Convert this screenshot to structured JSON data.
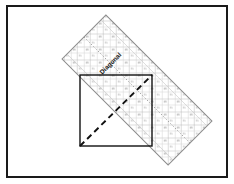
{
  "figure": {
    "frame": {
      "border_color": "#1a1a1a",
      "background_color": "#ffffff",
      "border_width_px": 2,
      "x": 6,
      "y": 5,
      "width": 222,
      "height": 173
    },
    "square": {
      "name": "fabric-square",
      "stroke_color": "#111111",
      "fill_color": "#ffffff",
      "left": 80,
      "top": 75,
      "width": 72,
      "height": 71,
      "label": "Fabric square"
    },
    "diagonal": {
      "name": "cut-line",
      "style": "dashed",
      "stroke_color": "#111111",
      "from_x": 80,
      "from_y": 146,
      "to_x": 152,
      "to_y": 75,
      "label": "Diagonal cut line"
    },
    "ruler": {
      "name": "quilting-ruler",
      "rotation_deg": 45,
      "center_x": 137,
      "center_y": 90,
      "length": 150,
      "width": 62,
      "outline_color": "#8c8c8c",
      "fill_color": "#ffffff",
      "grid_color": "#bdbdbd",
      "label": "Diagonal",
      "label_color": "#161616",
      "corners": [
        {
          "x": 115,
          "y": 28
        },
        {
          "x": 197,
          "y": 113
        },
        {
          "x": 158,
          "y": 152
        },
        {
          "x": 78,
          "y": 66
        }
      ],
      "center_guide": {
        "name": "ruler-center-guide",
        "style": "dotted",
        "color": "#9a9a9a"
      }
    }
  }
}
